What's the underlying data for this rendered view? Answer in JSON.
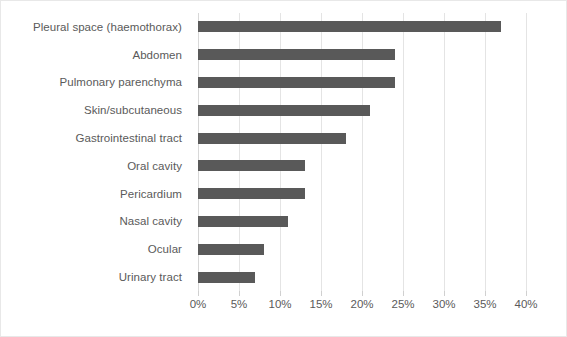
{
  "chart_data": {
    "type": "bar",
    "orientation": "horizontal",
    "title": "",
    "subtitle": "",
    "xlabel": "",
    "ylabel": "",
    "categories": [
      "Pleural space (haemothorax)",
      "Abdomen",
      "Pulmonary parenchyma",
      "Skin/subcutaneous",
      "Gastrointestinal tract",
      "Oral cavity",
      "Pericardium",
      "Nasal cavity",
      "Ocular",
      "Urinary tract"
    ],
    "values": [
      37,
      24,
      24,
      21,
      18,
      13,
      13,
      11,
      8,
      7
    ],
    "value_unit": "%",
    "xlim": [
      0,
      40
    ],
    "xticks": [
      0,
      5,
      10,
      15,
      20,
      25,
      30,
      35,
      40
    ],
    "xtick_labels": [
      "0%",
      "5%",
      "10%",
      "15%",
      "20%",
      "25%",
      "30%",
      "35%",
      "40%"
    ],
    "grid": "vertical",
    "legend": "none",
    "bar_color": "#595959",
    "gridline_color": "#e4e4e4",
    "text_color": "#5a5a5a"
  }
}
